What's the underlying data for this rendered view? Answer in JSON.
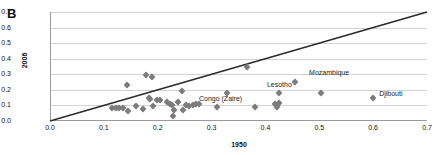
{
  "figure": {
    "panel_label": "B"
  },
  "chart_data": {
    "type": "scatter",
    "title": "",
    "xlabel": "1950",
    "ylabel": "2006",
    "xlim": [
      0.0,
      0.7
    ],
    "ylim": [
      0.0,
      0.7
    ],
    "grid": "horizontal",
    "legend": "none",
    "marker": "diamond",
    "marker_color": "#7c7c7c",
    "xticks": [
      "0.0",
      "0.1",
      "0.2",
      "0.3",
      "0.4",
      "0.5",
      "0.6",
      "0.7"
    ],
    "yticks": [
      "0.0",
      "0.1",
      "0.2",
      "0.3",
      "0.4",
      "0.5",
      "0.6",
      "0.7"
    ],
    "reference_line": {
      "label": "y = x",
      "color": "#2b2b2b",
      "from": [
        0.0,
        0.0
      ],
      "to": [
        0.7,
        0.7
      ]
    },
    "points": [
      {
        "x": 0.115,
        "y": 0.085
      },
      {
        "x": 0.122,
        "y": 0.082
      },
      {
        "x": 0.128,
        "y": 0.085
      },
      {
        "x": 0.135,
        "y": 0.082
      },
      {
        "x": 0.143,
        "y": 0.233
      },
      {
        "x": 0.145,
        "y": 0.062
      },
      {
        "x": 0.16,
        "y": 0.095
      },
      {
        "x": 0.172,
        "y": 0.08
      },
      {
        "x": 0.178,
        "y": 0.297
      },
      {
        "x": 0.183,
        "y": 0.145
      },
      {
        "x": 0.186,
        "y": 0.14
      },
      {
        "x": 0.19,
        "y": 0.281
      },
      {
        "x": 0.192,
        "y": 0.097
      },
      {
        "x": 0.198,
        "y": 0.135
      },
      {
        "x": 0.205,
        "y": 0.133
      },
      {
        "x": 0.218,
        "y": 0.12
      },
      {
        "x": 0.222,
        "y": 0.11
      },
      {
        "x": 0.226,
        "y": 0.105
      },
      {
        "x": 0.229,
        "y": 0.03
      },
      {
        "x": 0.231,
        "y": 0.072
      },
      {
        "x": 0.238,
        "y": 0.122
      },
      {
        "x": 0.245,
        "y": 0.193
      },
      {
        "x": 0.247,
        "y": 0.068
      },
      {
        "x": 0.252,
        "y": 0.103
      },
      {
        "x": 0.258,
        "y": 0.098
      },
      {
        "x": 0.265,
        "y": 0.1
      },
      {
        "x": 0.272,
        "y": 0.112
      },
      {
        "x": 0.277,
        "y": 0.108
      },
      {
        "x": 0.31,
        "y": 0.09
      },
      {
        "x": 0.328,
        "y": 0.18
      },
      {
        "x": 0.365,
        "y": 0.345
      },
      {
        "x": 0.38,
        "y": 0.09
      },
      {
        "x": 0.418,
        "y": 0.112
      },
      {
        "x": 0.422,
        "y": 0.092
      },
      {
        "x": 0.425,
        "y": 0.118
      },
      {
        "x": 0.425,
        "y": 0.18
      },
      {
        "x": 0.455,
        "y": 0.248
      },
      {
        "x": 0.503,
        "y": 0.182
      },
      {
        "x": 0.6,
        "y": 0.15
      }
    ],
    "annotations": [
      {
        "text": "Mozambique",
        "x": 0.455,
        "y": 0.248,
        "dx": 14,
        "dy": -9
      },
      {
        "text": "Lesotho",
        "x": 0.425,
        "y": 0.18,
        "dx": -12,
        "dy": -8
      },
      {
        "text": "Congo (Zaire)",
        "x": 0.31,
        "y": 0.09,
        "dx": -18,
        "dy": -8
      },
      {
        "text": "Djibouti",
        "x": 0.6,
        "y": 0.15,
        "dx": 6,
        "dy": -4
      }
    ]
  }
}
